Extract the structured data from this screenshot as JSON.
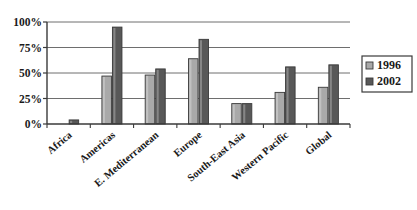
{
  "chart_data": {
    "type": "bar",
    "title": "",
    "xlabel": "",
    "ylabel": "",
    "categories": [
      "Africa",
      "Americas",
      "E. Mediterranean",
      "Europe",
      "South-East Asia",
      "Western Pacific",
      "Global"
    ],
    "series": [
      {
        "name": "1996",
        "color": "#a9a9a9",
        "values": [
          0,
          47,
          48,
          64,
          20,
          31,
          36
        ]
      },
      {
        "name": "2002",
        "color": "#585858",
        "values": [
          4,
          95,
          54,
          83,
          20,
          56,
          58
        ]
      }
    ],
    "ylim": [
      0,
      100
    ],
    "yticks": [
      0,
      25,
      50,
      75,
      100
    ],
    "ytick_labels": [
      "0%",
      "25%",
      "50%",
      "75%",
      "100%"
    ],
    "grid": true,
    "grid_axis": "y",
    "legend_position": "right",
    "legend_entries": [
      {
        "label": "1996",
        "color": "#a9a9a9"
      },
      {
        "label": "2002",
        "color": "#585858"
      }
    ]
  },
  "style": {
    "axis_color": "#3a3a3a",
    "grid_color": "#6e6e6e",
    "background": "#ffffff",
    "bar_edge": "#3a3a3a",
    "legend_border": "#3a3a3a"
  }
}
